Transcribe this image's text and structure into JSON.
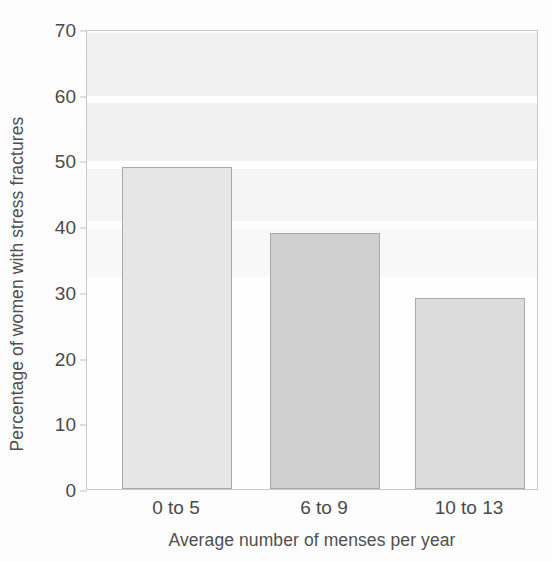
{
  "chart_data": {
    "type": "bar",
    "title": "",
    "subtitle": "",
    "categories": [
      "0 to 5",
      "6 to 9",
      "10 to 13"
    ],
    "values": [
      49,
      39,
      29
    ],
    "series": [
      {
        "name": "Percentage of women with stress fractures",
        "values": [
          49,
          39,
          29
        ]
      }
    ],
    "xlabel": "Average number of menses per year",
    "ylabel": "Percentage of women with stress fractures",
    "ylim": [
      0,
      70
    ],
    "yticks": [
      0,
      10,
      20,
      30,
      40,
      50,
      60,
      70
    ],
    "ytick_labels": [
      "0",
      "10",
      "20",
      "30",
      "40",
      "50",
      "60",
      "70"
    ],
    "grid": false,
    "legend": false,
    "legend_position": "none",
    "bar_colors": [
      "#e6e6e6",
      "#cfcfcf",
      "#dcdcdc"
    ],
    "bar_edge_color": "#a9a9a9",
    "annotations": []
  },
  "axes": {
    "y_tick_labels": [
      "70",
      "60",
      "50",
      "40",
      "30",
      "20",
      "10",
      "0"
    ],
    "y_label": "Percentage of women with stress fractures",
    "x_label": "Average number of menses per year"
  },
  "bars": [
    {
      "category": "0 to 5",
      "value": 49,
      "color": "#e6e6e6"
    },
    {
      "category": "6 to 9",
      "value": 39,
      "color": "#cfcfcf"
    },
    {
      "category": "10 to 13",
      "value": 29,
      "color": "#dcdcdc"
    }
  ],
  "style": {
    "frame_color": "#c9c9c9",
    "text_color": "#4a4a4a",
    "background": "#fdfdfd",
    "band_color": "#f1f1f1"
  }
}
